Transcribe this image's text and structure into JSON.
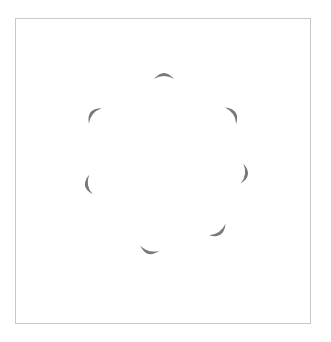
{
  "figure": {
    "frame": {
      "x": 15,
      "y": 18,
      "width": 296,
      "height": 306,
      "border_color": "#c8c8c8"
    },
    "crescent_color": "#787878",
    "center": {
      "x": 165,
      "y": 170
    },
    "crescents": [
      {
        "id": 1,
        "label": "top",
        "cx": 164,
        "cy": 76,
        "angle_deg": -90
      },
      {
        "id": 2,
        "label": "upper-right",
        "cx": 233,
        "cy": 114,
        "angle_deg": -35
      },
      {
        "id": 3,
        "label": "right",
        "cx": 245,
        "cy": 174,
        "angle_deg": 8
      },
      {
        "id": 4,
        "label": "lower-right",
        "cx": 219,
        "cy": 232,
        "angle_deg": 55
      },
      {
        "id": 5,
        "label": "bottom",
        "cx": 149,
        "cy": 251,
        "angle_deg": 105
      },
      {
        "id": 6,
        "label": "left",
        "cx": 88,
        "cy": 185,
        "angle_deg": 170
      },
      {
        "id": 7,
        "label": "upper-left",
        "cx": 93,
        "cy": 114,
        "angle_deg": -140
      }
    ]
  }
}
